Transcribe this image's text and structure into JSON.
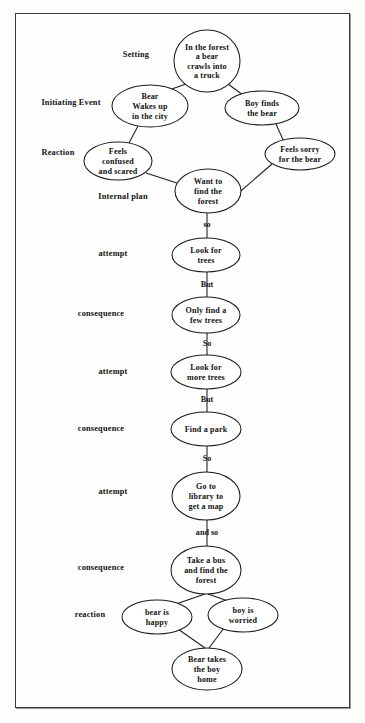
{
  "diagram": {
    "type": "story-grammar-flowchart",
    "frame_border_color": "#3a3a3a",
    "node_stroke_color": "#1c1c1c",
    "node_fill_color": "#ffffff",
    "text_color": "#111111"
  },
  "stage_labels": [
    {
      "id": "setting",
      "label": "Setting",
      "x": 136,
      "y": 57
    },
    {
      "id": "initiating-event",
      "label": "Initiating Event",
      "x": 71,
      "y": 105
    },
    {
      "id": "reaction-top",
      "label": "Reaction",
      "x": 58,
      "y": 155
    },
    {
      "id": "internal-plan",
      "label": "Internal plan",
      "x": 123,
      "y": 199
    },
    {
      "id": "attempt-1",
      "label": "attempt",
      "x": 113,
      "y": 256
    },
    {
      "id": "consequence-1",
      "label": "consequence",
      "x": 101,
      "y": 316
    },
    {
      "id": "attempt-2",
      "label": "attempt",
      "x": 113,
      "y": 374
    },
    {
      "id": "consequence-2",
      "label": "consequence",
      "x": 101,
      "y": 431
    },
    {
      "id": "attempt-3",
      "label": "attempt",
      "x": 113,
      "y": 494
    },
    {
      "id": "consequence-3",
      "label": "consequence",
      "x": 101,
      "y": 570
    },
    {
      "id": "reaction-bottom",
      "label": "reaction",
      "x": 90,
      "y": 617
    }
  ],
  "nodes": [
    {
      "id": "setting-node",
      "lines": [
        "In the forest",
        "a bear",
        "crawls into",
        "a truck"
      ],
      "cx": 207,
      "cy": 61,
      "rx": 33,
      "ry": 31
    },
    {
      "id": "bear-wakes-node",
      "lines": [
        "Bear",
        "Wakes up",
        "in the city"
      ],
      "cx": 150,
      "cy": 106,
      "rx": 38,
      "ry": 21
    },
    {
      "id": "boy-finds-node",
      "lines": [
        "Boy finds",
        "the bear"
      ],
      "cx": 262,
      "cy": 108,
      "rx": 37,
      "ry": 17
    },
    {
      "id": "feels-confused-node",
      "lines": [
        "Feels",
        "confused",
        "and scared"
      ],
      "cx": 118,
      "cy": 161,
      "rx": 34,
      "ry": 19
    },
    {
      "id": "feels-sorry-node",
      "lines": [
        "Feels sorry",
        "for the bear"
      ],
      "cx": 300,
      "cy": 154,
      "rx": 35,
      "ry": 16
    },
    {
      "id": "want-forest-node",
      "lines": [
        "Want to",
        "find the",
        "forest"
      ],
      "cx": 208,
      "cy": 191,
      "rx": 33,
      "ry": 22
    },
    {
      "id": "look-trees-node",
      "lines": [
        "Look for",
        "trees"
      ],
      "cx": 206,
      "cy": 255,
      "rx": 34,
      "ry": 17
    },
    {
      "id": "only-few-trees-node",
      "lines": [
        "Only find a",
        "few trees"
      ],
      "cx": 206,
      "cy": 315,
      "rx": 34,
      "ry": 18
    },
    {
      "id": "look-more-trees-node",
      "lines": [
        "Look for",
        "more trees"
      ],
      "cx": 206,
      "cy": 372,
      "rx": 35,
      "ry": 17
    },
    {
      "id": "find-park-node",
      "lines": [
        "Find a park"
      ],
      "cx": 206,
      "cy": 429,
      "rx": 35,
      "ry": 17
    },
    {
      "id": "library-map-node",
      "lines": [
        "Go to",
        "library to",
        "get a map"
      ],
      "cx": 206,
      "cy": 496,
      "rx": 34,
      "ry": 24
    },
    {
      "id": "take-bus-node",
      "lines": [
        "Take a bus",
        "and find the",
        "forest"
      ],
      "cx": 206,
      "cy": 570,
      "rx": 35,
      "ry": 24
    },
    {
      "id": "bear-happy-node",
      "lines": [
        "bear is",
        "happy"
      ],
      "cx": 157,
      "cy": 617,
      "rx": 35,
      "ry": 17
    },
    {
      "id": "boy-worried-node",
      "lines": [
        "boy is",
        "worried"
      ],
      "cx": 243,
      "cy": 615,
      "rx": 35,
      "ry": 17
    },
    {
      "id": "bear-takes-boy-node",
      "lines": [
        "Bear takes",
        "the boy",
        "home"
      ],
      "cx": 207,
      "cy": 669,
      "rx": 35,
      "ry": 21
    }
  ],
  "connector_labels": [
    {
      "id": "so-1",
      "label": "so",
      "x": 207,
      "y": 227
    },
    {
      "id": "but-1",
      "label": "But",
      "x": 207,
      "y": 287
    },
    {
      "id": "so-2",
      "label": "So",
      "x": 207,
      "y": 346
    },
    {
      "id": "but-2",
      "label": "But",
      "x": 207,
      "y": 402
    },
    {
      "id": "so-3",
      "label": "So",
      "x": 207,
      "y": 461
    },
    {
      "id": "and-so",
      "label": "and so",
      "x": 207,
      "y": 535
    }
  ],
  "edges": [
    {
      "id": "setting-to-bear-wakes",
      "from": "setting-node",
      "to": "bear-wakes-node",
      "x1": 186,
      "y1": 84,
      "x2": 169,
      "y2": 90
    },
    {
      "id": "setting-to-boy-finds",
      "from": "setting-node",
      "to": "boy-finds-node",
      "x1": 228,
      "y1": 84,
      "x2": 243,
      "y2": 95
    },
    {
      "id": "bear-wakes-to-feels-confused",
      "from": "bear-wakes-node",
      "to": "feels-confused-node",
      "x1": 138,
      "y1": 126,
      "x2": 129,
      "y2": 143
    },
    {
      "id": "boy-finds-to-feels-sorry",
      "from": "boy-finds-node",
      "to": "feels-sorry-node",
      "x1": 276,
      "y1": 124,
      "x2": 284,
      "y2": 142
    },
    {
      "id": "feels-confused-to-want-forest",
      "from": "feels-confused-node",
      "to": "want-forest-node",
      "x1": 146,
      "y1": 173,
      "x2": 180,
      "y2": 184
    },
    {
      "id": "feels-sorry-to-want-forest",
      "from": "feels-sorry-node",
      "to": "want-forest-node",
      "x1": 272,
      "y1": 164,
      "x2": 235,
      "y2": 196
    },
    {
      "id": "want-forest-to-look-trees",
      "from": "want-forest-node",
      "to": "look-trees-node",
      "x1": 207,
      "y1": 213,
      "x2": 207,
      "y2": 238
    },
    {
      "id": "look-trees-to-only-few",
      "from": "look-trees-node",
      "to": "only-few-trees-node",
      "x1": 207,
      "y1": 272,
      "x2": 207,
      "y2": 297
    },
    {
      "id": "only-few-to-look-more",
      "from": "only-few-trees-node",
      "to": "look-more-trees-node",
      "x1": 207,
      "y1": 333,
      "x2": 207,
      "y2": 355
    },
    {
      "id": "look-more-to-find-park",
      "from": "look-more-trees-node",
      "to": "find-park-node",
      "x1": 207,
      "y1": 389,
      "x2": 207,
      "y2": 412
    },
    {
      "id": "find-park-to-library",
      "from": "find-park-node",
      "to": "library-map-node",
      "x1": 207,
      "y1": 446,
      "x2": 207,
      "y2": 472
    },
    {
      "id": "library-to-take-bus",
      "from": "library-map-node",
      "to": "take-bus-node",
      "x1": 207,
      "y1": 520,
      "x2": 207,
      "y2": 546
    },
    {
      "id": "take-bus-to-bear-happy",
      "from": "take-bus-node",
      "to": "bear-happy-node",
      "x1": 205,
      "y1": 594,
      "x2": 176,
      "y2": 604
    },
    {
      "id": "take-bus-to-boy-worried",
      "from": "take-bus-node",
      "to": "boy-worried-node",
      "x1": 208,
      "y1": 594,
      "x2": 228,
      "y2": 601
    },
    {
      "id": "bear-happy-to-bear-takes",
      "from": "bear-happy-node",
      "to": "bear-takes-boy-node",
      "x1": 178,
      "y1": 629,
      "x2": 205,
      "y2": 648
    },
    {
      "id": "boy-worried-to-bear-takes",
      "from": "boy-worried-node",
      "to": "bear-takes-boy-node",
      "x1": 224,
      "y1": 628,
      "x2": 209,
      "y2": 648
    }
  ]
}
